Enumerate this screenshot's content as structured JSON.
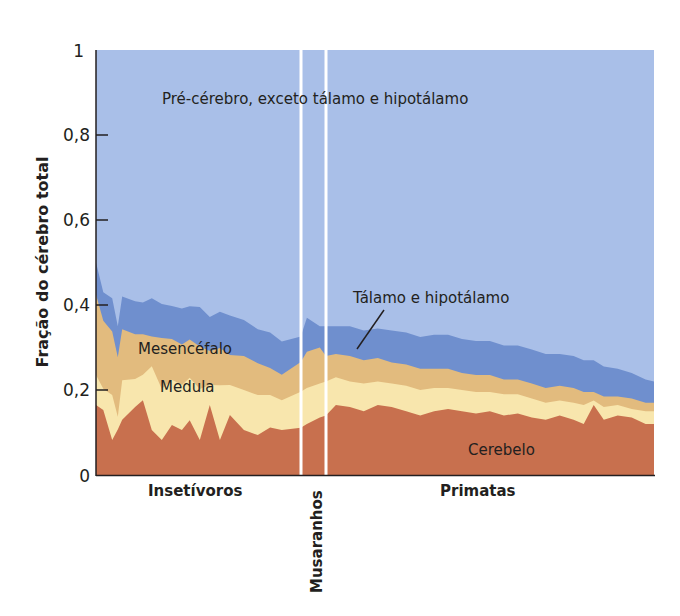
{
  "chart_data": {
    "type": "area",
    "stacked": true,
    "title": "",
    "xlabel": "",
    "ylabel": "Fração do cérebro total",
    "ylim": [
      0,
      1
    ],
    "yticks": [
      {
        "value": 0,
        "label": "0"
      },
      {
        "value": 0.2,
        "label": "0,2"
      },
      {
        "value": 0.4,
        "label": "0,4"
      },
      {
        "value": 0.6,
        "label": "0,6"
      },
      {
        "value": 0.8,
        "label": "0,8"
      },
      {
        "value": 1,
        "label": "1"
      }
    ],
    "grid": false,
    "groups": [
      {
        "name": "Insetívoros",
        "x_range": [
          0,
          0.367
        ]
      },
      {
        "name": "Musaranhos",
        "x_range": [
          0.367,
          0.412
        ],
        "vertical_label": true
      },
      {
        "name": "Primatas",
        "x_range": [
          0.412,
          1
        ]
      }
    ],
    "x": [
      0,
      0.013,
      0.029,
      0.039,
      0.047,
      0.07,
      0.084,
      0.1,
      0.118,
      0.136,
      0.154,
      0.168,
      0.186,
      0.204,
      0.222,
      0.24,
      0.265,
      0.29,
      0.312,
      0.333,
      0.367,
      0.378,
      0.401,
      0.412,
      0.43,
      0.455,
      0.48,
      0.505,
      0.53,
      0.556,
      0.581,
      0.606,
      0.631,
      0.656,
      0.681,
      0.706,
      0.731,
      0.756,
      0.781,
      0.806,
      0.831,
      0.856,
      0.874,
      0.892,
      0.91,
      0.935,
      0.96,
      0.985,
      1.0
    ],
    "series": [
      {
        "name": "Cerebelo",
        "color": "#c8704e",
        "values": [
          0.165,
          0.153,
          0.082,
          0.107,
          0.13,
          0.16,
          0.176,
          0.106,
          0.082,
          0.118,
          0.106,
          0.129,
          0.082,
          0.165,
          0.082,
          0.141,
          0.106,
          0.094,
          0.112,
          0.106,
          0.111,
          0.12,
          0.135,
          0.14,
          0.165,
          0.16,
          0.15,
          0.165,
          0.16,
          0.15,
          0.14,
          0.15,
          0.155,
          0.15,
          0.145,
          0.15,
          0.14,
          0.145,
          0.135,
          0.13,
          0.14,
          0.13,
          0.12,
          0.165,
          0.13,
          0.14,
          0.135,
          0.12,
          0.12
        ]
      },
      {
        "name": "Medula",
        "color": "#f8e6ad",
        "values": [
          0.07,
          0.05,
          0.106,
          0.03,
          0.093,
          0.066,
          0.06,
          0.15,
          0.12,
          0.106,
          0.106,
          0.1,
          0.12,
          0.047,
          0.129,
          0.071,
          0.094,
          0.094,
          0.076,
          0.07,
          0.085,
          0.085,
          0.08,
          0.08,
          0.065,
          0.06,
          0.065,
          0.055,
          0.055,
          0.06,
          0.06,
          0.055,
          0.05,
          0.05,
          0.05,
          0.045,
          0.05,
          0.045,
          0.045,
          0.04,
          0.035,
          0.04,
          0.045,
          0.01,
          0.03,
          0.025,
          0.02,
          0.03,
          0.03
        ]
      },
      {
        "name": "Mesencéfalo",
        "color": "#e2bb7e",
        "values": [
          0.19,
          0.16,
          0.15,
          0.14,
          0.12,
          0.105,
          0.095,
          0.07,
          0.12,
          0.096,
          0.095,
          0.09,
          0.1,
          0.08,
          0.088,
          0.07,
          0.08,
          0.075,
          0.064,
          0.06,
          0.07,
          0.085,
          0.085,
          0.06,
          0.055,
          0.06,
          0.055,
          0.055,
          0.05,
          0.05,
          0.05,
          0.045,
          0.045,
          0.04,
          0.04,
          0.04,
          0.035,
          0.035,
          0.035,
          0.035,
          0.035,
          0.035,
          0.03,
          0.02,
          0.025,
          0.02,
          0.025,
          0.02,
          0.02
        ]
      },
      {
        "name": "Tálamo e hipotálamo",
        "color": "#6f8fce",
        "values": [
          0.075,
          0.067,
          0.078,
          0.073,
          0.077,
          0.078,
          0.075,
          0.09,
          0.08,
          0.078,
          0.085,
          0.078,
          0.093,
          0.08,
          0.085,
          0.093,
          0.085,
          0.08,
          0.083,
          0.078,
          0.06,
          0.08,
          0.05,
          0.07,
          0.065,
          0.07,
          0.07,
          0.07,
          0.075,
          0.075,
          0.075,
          0.08,
          0.08,
          0.08,
          0.08,
          0.08,
          0.08,
          0.08,
          0.08,
          0.08,
          0.075,
          0.075,
          0.075,
          0.075,
          0.07,
          0.065,
          0.06,
          0.055,
          0.05
        ]
      },
      {
        "name": "Pré-cérebro, exceto tálamo e hipotálamo",
        "color": "#a9bfe8",
        "values": "remainder to 1.0"
      }
    ],
    "annotations": [
      {
        "text": "Pré-cérebro, exceto tálamo e hipotálamo"
      },
      {
        "text": "Tálamo e hipotálamo",
        "leader_line": true
      },
      {
        "text": "Mesencéfalo"
      },
      {
        "text": "Medula"
      },
      {
        "text": "Cerebelo"
      }
    ]
  },
  "labels": {
    "ylabel": "Fração do cérebro total",
    "ytick_0": "0",
    "ytick_02": "0,2",
    "ytick_04": "0,4",
    "ytick_06": "0,6",
    "ytick_08": "0,8",
    "ytick_1": "1",
    "forebrain": "Pré-cérebro, exceto tálamo e hipotálamo",
    "thalamus": "Tálamo e hipotálamo",
    "midbrain": "Mesencéfalo",
    "medulla": "Medula",
    "cerebellum": "Cerebelo",
    "group_insectivores": "Insetívoros",
    "group_shrews": "Musaranhos",
    "group_primates": "Primatas"
  }
}
